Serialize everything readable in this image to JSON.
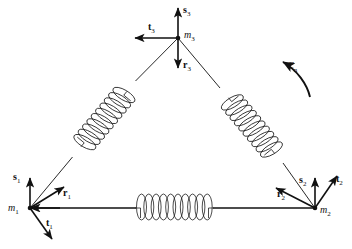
{
  "figure": {
    "type": "mechanical-schematic",
    "background_color": "#ffffff",
    "line_color": "#111111",
    "masses": [
      {
        "id": "m1",
        "label": "m",
        "subscript": "1",
        "x": 30,
        "y": 208
      },
      {
        "id": "m2",
        "label": "m",
        "subscript": "2",
        "x": 315,
        "y": 208
      },
      {
        "id": "m3",
        "label": "m",
        "subscript": "3",
        "x": 178,
        "y": 38
      }
    ],
    "springs": [
      {
        "id": "spring-m1-m3",
        "from": "m1",
        "to": "m3",
        "coils": 9,
        "orientation": "diagonal-left"
      },
      {
        "id": "spring-m3-m2",
        "from": "m3",
        "to": "m2",
        "coils": 9,
        "orientation": "diagonal-right"
      },
      {
        "id": "spring-m1-m2",
        "from": "m1",
        "to": "m2",
        "coils": 10,
        "orientation": "horizontal"
      }
    ],
    "vectors": [
      {
        "id": "s1",
        "label": "s",
        "subscript": "1",
        "at": "m1",
        "direction": "up",
        "label_x": 14,
        "label_y": 176
      },
      {
        "id": "r1",
        "label": "r",
        "subscript": "1",
        "at": "m1",
        "direction": "up-right",
        "label_x": 68,
        "label_y": 191
      },
      {
        "id": "t1",
        "label": "t",
        "subscript": "1",
        "at": "m1",
        "direction": "down-right",
        "label_x": 49,
        "label_y": 224
      },
      {
        "id": "s2",
        "label": "s",
        "subscript": "2",
        "at": "m2",
        "direction": "up",
        "label_x": 300,
        "label_y": 179
      },
      {
        "id": "r2",
        "label": "r",
        "subscript": "2",
        "at": "m2",
        "direction": "up-left",
        "label_x": 280,
        "label_y": 195
      },
      {
        "id": "t2",
        "label": "t",
        "subscript": "2",
        "at": "m2",
        "direction": "up-right",
        "label_x": 336,
        "label_y": 180
      },
      {
        "id": "s3",
        "label": "s",
        "subscript": "3",
        "at": "m3",
        "direction": "up",
        "label_x": 183,
        "label_y": 9
      },
      {
        "id": "t3",
        "label": "t",
        "subscript": "3",
        "at": "m3",
        "direction": "left",
        "label_x": 149,
        "label_y": 24
      },
      {
        "id": "r3",
        "label": "r",
        "subscript": "3",
        "at": "m3",
        "direction": "down",
        "label_x": 183,
        "label_y": 63
      }
    ],
    "rotation_marker": {
      "id": "cn",
      "label": "C",
      "subscript": "n",
      "label_x": 288,
      "label_y": 64,
      "arrow_direction": "counterclockwise-up-left"
    }
  }
}
